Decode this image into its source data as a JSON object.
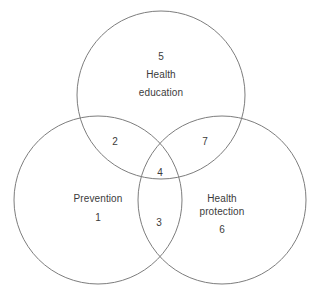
{
  "figure": {
    "type": "venn-diagram",
    "width": 315,
    "height": 298,
    "background_color": "#ffffff",
    "stroke_color": "#7d7d7d",
    "text_color": "#3b3b3b"
  },
  "sets": [
    {
      "id": "health-education",
      "label": "Health education",
      "label_line_1": "Health",
      "label_line_2": "education",
      "region_number": "5",
      "position": "top",
      "center_x": 161,
      "center_y": 95,
      "radius": 84
    },
    {
      "id": "prevention",
      "label": "Prevention",
      "label_line_1": "Prevention",
      "label_line_2": "",
      "region_number": "1",
      "position": "bottom-left",
      "center_x": 98,
      "center_y": 200,
      "radius": 84
    },
    {
      "id": "health-protection",
      "label": "Health protection",
      "label_line_1": "Health",
      "label_line_2": "protection",
      "region_number": "6",
      "position": "bottom-right",
      "center_x": 222,
      "center_y": 200,
      "radius": 84
    }
  ],
  "intersections": [
    {
      "id": "education-prevention",
      "number": "2",
      "sets": "Health education + Prevention"
    },
    {
      "id": "education-protection",
      "number": "7",
      "sets": "Health education + Health protection"
    },
    {
      "id": "prevention-protection",
      "number": "3",
      "sets": "Prevention + Health protection"
    },
    {
      "id": "all-three",
      "number": "4",
      "sets": "Health education + Prevention + Health protection"
    }
  ]
}
